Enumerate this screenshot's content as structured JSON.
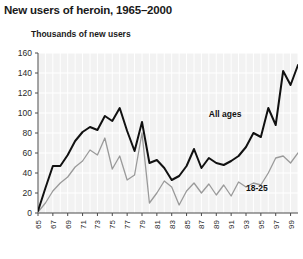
{
  "chart_data": {
    "type": "line",
    "title": "New users of heroin, 1965–2000",
    "ylabel": "Thousands of new users",
    "xlabel": "",
    "ylim": [
      0,
      160
    ],
    "yticks": [
      0,
      20,
      40,
      60,
      80,
      100,
      120,
      140,
      160
    ],
    "xlim": [
      1965,
      2000
    ],
    "xticks": [
      1965,
      1967,
      1969,
      1971,
      1973,
      1975,
      1977,
      1979,
      1981,
      1983,
      1985,
      1987,
      1989,
      1991,
      1993,
      1995,
      1997,
      1999
    ],
    "xtick_labels": [
      "65",
      "67",
      "69",
      "71",
      "73",
      "75",
      "77",
      "79",
      "81",
      "83",
      "85",
      "87",
      "89",
      "91",
      "93",
      "95",
      "97",
      "99"
    ],
    "grid": true,
    "legend_position": "inline-annotation",
    "x": [
      1965,
      1966,
      1967,
      1968,
      1969,
      1970,
      1971,
      1972,
      1973,
      1974,
      1975,
      1976,
      1977,
      1978,
      1979,
      1980,
      1981,
      1982,
      1983,
      1984,
      1985,
      1986,
      1987,
      1988,
      1989,
      1990,
      1991,
      1992,
      1993,
      1994,
      1995,
      1996,
      1997,
      1998,
      1999,
      2000
    ],
    "series": [
      {
        "name": "All ages",
        "color": "#111111",
        "label_x": 1988,
        "label_y": 96,
        "values": [
          2,
          25,
          47,
          47,
          58,
          72,
          81,
          86,
          83,
          97,
          92,
          105,
          82,
          62,
          91,
          50,
          53,
          45,
          33,
          37,
          47,
          64,
          45,
          55,
          50,
          48,
          52,
          57,
          66,
          80,
          76,
          105,
          88,
          142,
          128,
          148
        ]
      },
      {
        "name": "18-25",
        "color": "#9a9a9a",
        "label_x": 1993,
        "label_y": 22,
        "values": [
          1,
          10,
          22,
          30,
          36,
          46,
          52,
          63,
          58,
          75,
          44,
          57,
          33,
          38,
          80,
          10,
          20,
          32,
          26,
          8,
          22,
          30,
          20,
          29,
          18,
          28,
          17,
          31,
          26,
          30,
          28,
          40,
          55,
          57,
          50,
          60
        ]
      }
    ]
  }
}
